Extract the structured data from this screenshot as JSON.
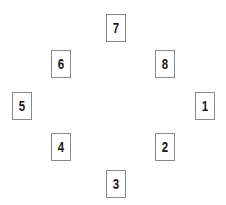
{
  "figure": {
    "type": "diagram",
    "background_color": "#ffffff",
    "box_border_color": "#8a8a8a",
    "label_color": "#1a1a1a",
    "box_width": 20,
    "box_height": 28,
    "nodes": [
      {
        "label": "7",
        "name": "node-7",
        "x": 106,
        "y": 14
      },
      {
        "label": "8",
        "name": "node-8",
        "x": 155,
        "y": 50
      },
      {
        "label": "1",
        "name": "node-1",
        "x": 195,
        "y": 92
      },
      {
        "label": "2",
        "name": "node-2",
        "x": 155,
        "y": 133
      },
      {
        "label": "3",
        "name": "node-3",
        "x": 106,
        "y": 170
      },
      {
        "label": "4",
        "name": "node-4",
        "x": 51,
        "y": 133
      },
      {
        "label": "5",
        "name": "node-5",
        "x": 12,
        "y": 92
      },
      {
        "label": "6",
        "name": "node-6",
        "x": 51,
        "y": 50
      }
    ]
  }
}
